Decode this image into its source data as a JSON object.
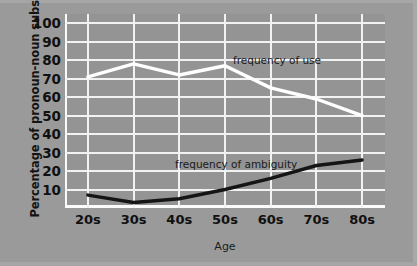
{
  "chart_data": {
    "type": "line",
    "title": "",
    "xlabel": "Age",
    "ylabel": "Percentage of pronoun-noun substitutions",
    "categories": [
      "20s",
      "30s",
      "40s",
      "50s",
      "60s",
      "70s",
      "80s"
    ],
    "ylim": [
      0,
      105
    ],
    "yticks": [
      10,
      20,
      30,
      40,
      50,
      60,
      70,
      80,
      90,
      100
    ],
    "grid": true,
    "legend_position": "inline-annotation",
    "series": [
      {
        "name": "frequency of use",
        "color": "#ffffff",
        "values": [
          71,
          78,
          72,
          77,
          65,
          59,
          50
        ],
        "annotation": "frequency of use"
      },
      {
        "name": "frequency of ambiguity",
        "color": "#151515",
        "values": [
          7,
          3,
          5,
          10,
          16,
          23,
          26
        ],
        "annotation": "frequency of ambiguity"
      }
    ]
  },
  "colors": {
    "background": "#9a9a9a",
    "plot_background": "#949494",
    "gridline": "#f2f2f2",
    "use_line": "#ffffff",
    "ambiguity_line": "#151515",
    "text": "#101010"
  }
}
